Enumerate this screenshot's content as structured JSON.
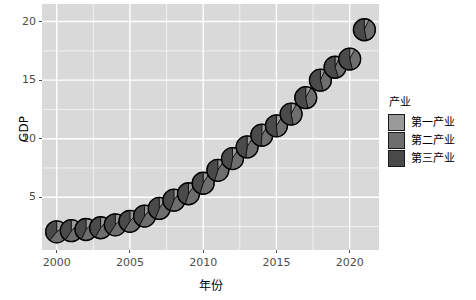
{
  "chart_data": {
    "type": "scatterpie",
    "title": "",
    "xlabel": "年份",
    "ylabel": "GDP",
    "xlim": [
      1999,
      2022
    ],
    "ylim": [
      0.5,
      21.5
    ],
    "xticks": [
      2000,
      2005,
      2010,
      2015,
      2020
    ],
    "yticks": [
      5,
      10,
      15,
      20
    ],
    "grid": true,
    "legend": {
      "title": "产业",
      "position": "right",
      "entries": [
        {
          "label": "第一产业",
          "color": "#9a9a9a"
        },
        {
          "label": "第二产业",
          "color": "#6e6e6e"
        },
        {
          "label": "第三产业",
          "color": "#4a4a4a"
        }
      ]
    },
    "x": [
      2000,
      2001,
      2002,
      2003,
      2004,
      2005,
      2006,
      2007,
      2008,
      2009,
      2010,
      2011,
      2012,
      2013,
      2014,
      2015,
      2016,
      2017,
      2018,
      2019,
      2020,
      2021
    ],
    "values": [
      1.0,
      1.1,
      1.21,
      1.36,
      1.61,
      1.87,
      2.2,
      2.73,
      3.22,
      3.55,
      4.22,
      4.97,
      5.53,
      6.1,
      6.6,
      7.03,
      7.56,
      8.3,
      9.06,
      9.56,
      10.0,
      11.2
    ],
    "series": [
      {
        "name": "第一产业",
        "color": "#9a9a9a",
        "values": [
          0.14,
          0.14,
          0.15,
          0.16,
          0.2,
          0.22,
          0.24,
          0.28,
          0.33,
          0.35,
          0.4,
          0.45,
          0.5,
          0.54,
          0.57,
          0.6,
          0.62,
          0.64,
          0.66,
          0.71,
          0.78,
          0.83
        ]
      },
      {
        "name": "第二产业",
        "color": "#6e6e6e",
        "values": [
          0.46,
          0.49,
          0.54,
          0.62,
          0.74,
          0.87,
          1.03,
          1.26,
          1.49,
          1.6,
          1.92,
          2.27,
          2.44,
          2.62,
          2.78,
          2.82,
          2.96,
          3.23,
          3.55,
          3.72,
          3.84,
          4.51
        ]
      },
      {
        "name": "第三产业",
        "color": "#4a4a4a",
        "values": [
          0.4,
          0.47,
          0.52,
          0.58,
          0.67,
          0.78,
          0.93,
          1.19,
          1.4,
          1.6,
          1.9,
          2.25,
          2.59,
          2.94,
          3.25,
          3.61,
          3.98,
          4.43,
          4.85,
          5.13,
          5.38,
          5.86
        ]
      }
    ],
    "points": [
      {
        "year": 2000,
        "gdp": 1.0,
        "shares": [
          0.15,
          0.46,
          0.39
        ]
      },
      {
        "year": 2001,
        "gdp": 1.1,
        "shares": [
          0.14,
          0.45,
          0.41
        ]
      },
      {
        "year": 2002,
        "gdp": 1.21,
        "shares": [
          0.13,
          0.44,
          0.43
        ]
      },
      {
        "year": 2003,
        "gdp": 1.36,
        "shares": [
          0.12,
          0.46,
          0.42
        ]
      },
      {
        "year": 2004,
        "gdp": 1.61,
        "shares": [
          0.13,
          0.46,
          0.41
        ]
      },
      {
        "year": 2005,
        "gdp": 1.87,
        "shares": [
          0.12,
          0.47,
          0.41
        ]
      },
      {
        "year": 2006,
        "gdp": 2.2,
        "shares": [
          0.11,
          0.47,
          0.42
        ]
      },
      {
        "year": 2007,
        "gdp": 2.73,
        "shares": [
          0.1,
          0.46,
          0.44
        ]
      },
      {
        "year": 2008,
        "gdp": 3.22,
        "shares": [
          0.1,
          0.46,
          0.44
        ]
      },
      {
        "year": 2009,
        "gdp": 3.55,
        "shares": [
          0.1,
          0.45,
          0.45
        ]
      },
      {
        "year": 2010,
        "gdp": 4.22,
        "shares": [
          0.09,
          0.46,
          0.45
        ]
      },
      {
        "year": 2011,
        "gdp": 4.97,
        "shares": [
          0.09,
          0.46,
          0.45
        ]
      },
      {
        "year": 2012,
        "gdp": 5.53,
        "shares": [
          0.09,
          0.44,
          0.47
        ]
      },
      {
        "year": 2013,
        "gdp": 6.1,
        "shares": [
          0.09,
          0.43,
          0.48
        ]
      },
      {
        "year": 2014,
        "gdp": 6.6,
        "shares": [
          0.09,
          0.42,
          0.49
        ]
      },
      {
        "year": 2015,
        "gdp": 7.03,
        "shares": [
          0.09,
          0.4,
          0.51
        ]
      },
      {
        "year": 2016,
        "gdp": 7.56,
        "shares": [
          0.08,
          0.39,
          0.53
        ]
      },
      {
        "year": 2017,
        "gdp": 8.3,
        "shares": [
          0.08,
          0.39,
          0.53
        ]
      },
      {
        "year": 2018,
        "gdp": 9.06,
        "shares": [
          0.07,
          0.39,
          0.54
        ]
      },
      {
        "year": 2019,
        "gdp": 9.56,
        "shares": [
          0.07,
          0.38,
          0.55
        ]
      },
      {
        "year": 2020,
        "gdp": 10.0,
        "shares": [
          0.08,
          0.38,
          0.54
        ]
      },
      {
        "year": 2021,
        "gdp": 11.2,
        "shares": [
          0.07,
          0.4,
          0.53
        ]
      }
    ],
    "plot_points": [
      {
        "year": 2000,
        "y": 2.05
      },
      {
        "year": 2001,
        "y": 2.15
      },
      {
        "year": 2002,
        "y": 2.25
      },
      {
        "year": 2003,
        "y": 2.4
      },
      {
        "year": 2004,
        "y": 2.65
      },
      {
        "year": 2005,
        "y": 2.95
      },
      {
        "year": 2006,
        "y": 3.4
      },
      {
        "year": 2007,
        "y": 4.05
      },
      {
        "year": 2008,
        "y": 4.75
      },
      {
        "year": 2009,
        "y": 5.3
      },
      {
        "year": 2010,
        "y": 6.2
      },
      {
        "year": 2011,
        "y": 7.3
      },
      {
        "year": 2012,
        "y": 8.3
      },
      {
        "year": 2013,
        "y": 9.3
      },
      {
        "year": 2014,
        "y": 10.3
      },
      {
        "year": 2015,
        "y": 11.1
      },
      {
        "year": 2016,
        "y": 12.1
      },
      {
        "year": 2017,
        "y": 13.5
      },
      {
        "year": 2018,
        "y": 15.0
      },
      {
        "year": 2019,
        "y": 16.1
      },
      {
        "year": 2020,
        "y": 16.8
      },
      {
        "year": 2021,
        "y": 19.3
      }
    ],
    "panel": {
      "background": "#d9d9d9",
      "gridline_major": "#ffffff",
      "gridline_minor": "#f2f2f2",
      "marker_outline": "#000000",
      "marker_radius_px": 11
    }
  }
}
